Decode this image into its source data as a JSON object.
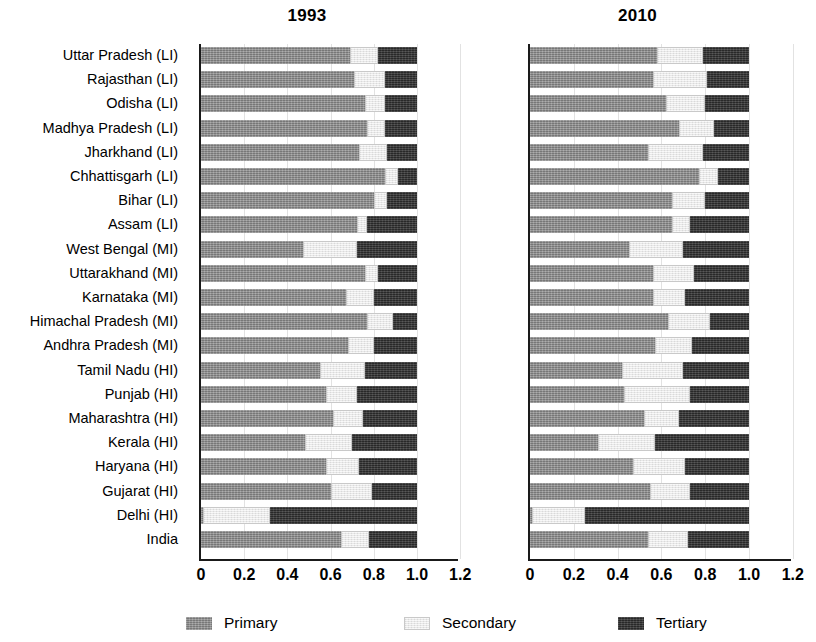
{
  "figure": {
    "panels": [
      {
        "id": "p1993",
        "title": "1993"
      },
      {
        "id": "p2010",
        "title": "2010"
      }
    ],
    "legend": [
      {
        "key": "primary",
        "label": "Primary",
        "color": "#8f8f8f"
      },
      {
        "key": "secondary",
        "label": "Secondary",
        "color": "#ececec"
      },
      {
        "key": "tertiary",
        "label": "Tertiary",
        "color": "#373737"
      }
    ],
    "xticks": [
      "0",
      "0.2",
      "0.4",
      "0.6",
      "0.8",
      "1.0",
      "1.2"
    ]
  },
  "chart_data": {
    "type": "bar",
    "title": "",
    "subtitle": "",
    "orientation": "horizontal",
    "stacked": true,
    "xlabel": "",
    "ylabel": "",
    "xlim": [
      0,
      1.2
    ],
    "xticks": [
      0,
      0.2,
      0.4,
      0.6,
      0.8,
      1.0,
      1.2
    ],
    "xtick_labels": [
      "0",
      "0.2",
      "0.4",
      "0.6",
      "0.8",
      "1.0",
      "1.2"
    ],
    "grid": true,
    "legend": [
      "Primary",
      "Secondary",
      "Tertiary"
    ],
    "legend_position": "bottom",
    "panel_titles": [
      "1993",
      "2010"
    ],
    "categories": [
      "Uttar Pradesh (LI)",
      "Rajasthan (LI)",
      "Odisha (LI)",
      "Madhya Pradesh (LI)",
      "Jharkhand (LI)",
      "Chhattisgarh (LI)",
      "Bihar (LI)",
      "Assam (LI)",
      "West Bengal (MI)",
      "Uttarakhand (MI)",
      "Karnataka (MI)",
      "Himachal Pradesh (MI)",
      "Andhra Pradesh (MI)",
      "Tamil Nadu (HI)",
      "Punjab (HI)",
      "Maharashtra (HI)",
      "Kerala  (HI)",
      "Haryana (HI)",
      "Gujarat (HI)",
      "Delhi (HI)",
      "India"
    ],
    "panels": [
      {
        "title": "1993",
        "series": [
          {
            "name": "Primary",
            "values": [
              0.69,
              0.71,
              0.76,
              0.77,
              0.73,
              0.85,
              0.8,
              0.72,
              0.47,
              0.76,
              0.67,
              0.77,
              0.68,
              0.55,
              0.58,
              0.61,
              0.48,
              0.58,
              0.6,
              0.01,
              0.65
            ]
          },
          {
            "name": "Secondary",
            "values": [
              0.13,
              0.14,
              0.09,
              0.08,
              0.13,
              0.06,
              0.06,
              0.05,
              0.25,
              0.06,
              0.13,
              0.12,
              0.12,
              0.21,
              0.14,
              0.14,
              0.22,
              0.15,
              0.19,
              0.31,
              0.13
            ]
          },
          {
            "name": "Tertiary",
            "values": [
              0.18,
              0.15,
              0.15,
              0.15,
              0.14,
              0.09,
              0.14,
              0.23,
              0.28,
              0.18,
              0.2,
              0.11,
              0.2,
              0.24,
              0.28,
              0.25,
              0.3,
              0.27,
              0.21,
              0.68,
              0.22
            ]
          }
        ]
      },
      {
        "title": "2010",
        "series": [
          {
            "name": "Primary",
            "values": [
              0.58,
              0.56,
              0.62,
              0.68,
              0.54,
              0.77,
              0.65,
              0.65,
              0.45,
              0.56,
              0.56,
              0.63,
              0.57,
              0.42,
              0.43,
              0.52,
              0.31,
              0.47,
              0.55,
              0.01,
              0.54
            ]
          },
          {
            "name": "Secondary",
            "values": [
              0.21,
              0.25,
              0.18,
              0.16,
              0.25,
              0.09,
              0.15,
              0.08,
              0.25,
              0.19,
              0.15,
              0.19,
              0.17,
              0.28,
              0.3,
              0.16,
              0.26,
              0.24,
              0.18,
              0.24,
              0.18
            ]
          },
          {
            "name": "Tertiary",
            "values": [
              0.21,
              0.19,
              0.2,
              0.16,
              0.21,
              0.14,
              0.2,
              0.27,
              0.3,
              0.25,
              0.29,
              0.18,
              0.26,
              0.3,
              0.27,
              0.32,
              0.43,
              0.29,
              0.27,
              0.75,
              0.28
            ]
          }
        ]
      }
    ]
  }
}
